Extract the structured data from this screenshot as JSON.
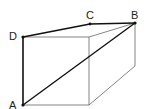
{
  "diagram": {
    "type": "cuboid",
    "labels": {
      "A": "A",
      "B": "B",
      "C": "C",
      "D": "D"
    },
    "points": {
      "A": [
        23,
        105
      ],
      "B": [
        135,
        23
      ],
      "C": [
        90,
        24
      ],
      "D": [
        23,
        37
      ],
      "front_top_right": [
        89,
        37
      ],
      "front_bottom_right": [
        89,
        105
      ],
      "back_bottom_right": [
        135,
        66
      ]
    },
    "thick_edges": [
      "D-C",
      "C-B",
      "D-A",
      "A-B"
    ],
    "thin_edges": [
      "D-front_top_right",
      "front_top_right-B",
      "front_top_right-front_bottom_right",
      "A-front_bottom_right",
      "front_bottom_right-back_bottom_right",
      "B-back_bottom_right"
    ],
    "colors": {
      "thick": "#111111",
      "thin": "#666666",
      "background": "#ffffff"
    }
  }
}
